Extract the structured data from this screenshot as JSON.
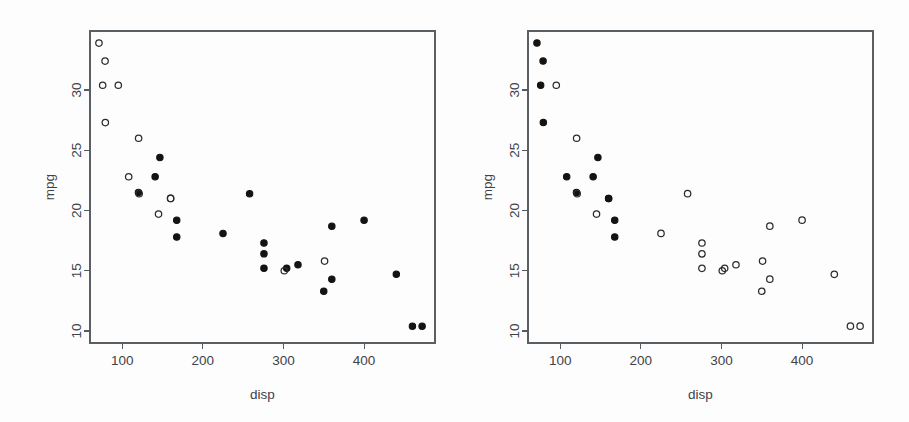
{
  "figure": {
    "kind": "two-panel-scatterplot",
    "background_color": "#fdfdfd",
    "foreground_color": "#2b2b2b",
    "panel_count": 2
  },
  "chart_data": [
    {
      "type": "scatter",
      "panel": "left",
      "title": "",
      "xlabel": "disp",
      "ylabel": "mpg",
      "xlim": [
        60,
        488
      ],
      "ylim": [
        9.0,
        34.9
      ],
      "xticks": [
        100,
        200,
        300,
        400
      ],
      "yticks": [
        10,
        15,
        20,
        25,
        30
      ],
      "xticklabels": [
        "100",
        "200",
        "300",
        "400"
      ],
      "yticklabels": [
        "10",
        "15",
        "20",
        "25",
        "30"
      ],
      "grid": false,
      "legend": "none",
      "marker_groups": [
        {
          "name": "open-circle",
          "fill": "none",
          "stroke": "#2b2b2b",
          "radius": 3.2
        },
        {
          "name": "filled-circle",
          "fill": "#131313",
          "stroke": "#131313",
          "radius": 3.2
        }
      ],
      "points": [
        {
          "x": 160.0,
          "y": 21.0,
          "marker": "open-circle"
        },
        {
          "x": 160.0,
          "y": 21.0,
          "marker": "open-circle"
        },
        {
          "x": 108.0,
          "y": 22.8,
          "marker": "open-circle"
        },
        {
          "x": 258.0,
          "y": 21.4,
          "marker": "filled-circle"
        },
        {
          "x": 360.0,
          "y": 18.7,
          "marker": "filled-circle"
        },
        {
          "x": 225.0,
          "y": 18.1,
          "marker": "filled-circle"
        },
        {
          "x": 360.0,
          "y": 14.3,
          "marker": "filled-circle"
        },
        {
          "x": 146.7,
          "y": 24.4,
          "marker": "filled-circle"
        },
        {
          "x": 140.8,
          "y": 22.8,
          "marker": "filled-circle"
        },
        {
          "x": 167.6,
          "y": 19.2,
          "marker": "filled-circle"
        },
        {
          "x": 167.6,
          "y": 17.8,
          "marker": "filled-circle"
        },
        {
          "x": 275.8,
          "y": 16.4,
          "marker": "filled-circle"
        },
        {
          "x": 275.8,
          "y": 17.3,
          "marker": "filled-circle"
        },
        {
          "x": 275.8,
          "y": 15.2,
          "marker": "filled-circle"
        },
        {
          "x": 472.0,
          "y": 10.4,
          "marker": "filled-circle"
        },
        {
          "x": 460.0,
          "y": 10.4,
          "marker": "filled-circle"
        },
        {
          "x": 440.0,
          "y": 14.7,
          "marker": "filled-circle"
        },
        {
          "x": 78.7,
          "y": 32.4,
          "marker": "open-circle"
        },
        {
          "x": 75.7,
          "y": 30.4,
          "marker": "open-circle"
        },
        {
          "x": 71.1,
          "y": 33.9,
          "marker": "open-circle"
        },
        {
          "x": 120.1,
          "y": 21.5,
          "marker": "filled-circle"
        },
        {
          "x": 318.0,
          "y": 15.5,
          "marker": "filled-circle"
        },
        {
          "x": 304.0,
          "y": 15.2,
          "marker": "filled-circle"
        },
        {
          "x": 350.0,
          "y": 13.3,
          "marker": "filled-circle"
        },
        {
          "x": 400.0,
          "y": 19.2,
          "marker": "filled-circle"
        },
        {
          "x": 79.0,
          "y": 27.3,
          "marker": "open-circle"
        },
        {
          "x": 120.3,
          "y": 26.0,
          "marker": "open-circle"
        },
        {
          "x": 95.1,
          "y": 30.4,
          "marker": "open-circle"
        },
        {
          "x": 351.0,
          "y": 15.8,
          "marker": "open-circle"
        },
        {
          "x": 145.0,
          "y": 19.7,
          "marker": "open-circle"
        },
        {
          "x": 301.0,
          "y": 15.0,
          "marker": "open-circle"
        },
        {
          "x": 121.0,
          "y": 21.4,
          "marker": "open-circle"
        }
      ]
    },
    {
      "type": "scatter",
      "panel": "right",
      "title": "",
      "xlabel": "disp",
      "ylabel": "mpg",
      "xlim": [
        60,
        488
      ],
      "ylim": [
        9.0,
        34.9
      ],
      "xticks": [
        100,
        200,
        300,
        400
      ],
      "yticks": [
        10,
        15,
        20,
        25,
        30
      ],
      "xticklabels": [
        "100",
        "200",
        "300",
        "400"
      ],
      "yticklabels": [
        "10",
        "15",
        "20",
        "25",
        "30"
      ],
      "grid": false,
      "legend": "none",
      "marker_groups": [
        {
          "name": "open-circle",
          "fill": "none",
          "stroke": "#2b2b2b",
          "radius": 3.2
        },
        {
          "name": "filled-circle",
          "fill": "#131313",
          "stroke": "#131313",
          "radius": 3.2
        }
      ],
      "points": [
        {
          "x": 160.0,
          "y": 21.0,
          "marker": "filled-circle"
        },
        {
          "x": 160.0,
          "y": 21.0,
          "marker": "filled-circle"
        },
        {
          "x": 108.0,
          "y": 22.8,
          "marker": "filled-circle"
        },
        {
          "x": 258.0,
          "y": 21.4,
          "marker": "open-circle"
        },
        {
          "x": 360.0,
          "y": 18.7,
          "marker": "open-circle"
        },
        {
          "x": 225.0,
          "y": 18.1,
          "marker": "open-circle"
        },
        {
          "x": 360.0,
          "y": 14.3,
          "marker": "open-circle"
        },
        {
          "x": 146.7,
          "y": 24.4,
          "marker": "filled-circle"
        },
        {
          "x": 140.8,
          "y": 22.8,
          "marker": "filled-circle"
        },
        {
          "x": 167.6,
          "y": 19.2,
          "marker": "filled-circle"
        },
        {
          "x": 167.6,
          "y": 17.8,
          "marker": "filled-circle"
        },
        {
          "x": 275.8,
          "y": 16.4,
          "marker": "open-circle"
        },
        {
          "x": 275.8,
          "y": 17.3,
          "marker": "open-circle"
        },
        {
          "x": 275.8,
          "y": 15.2,
          "marker": "open-circle"
        },
        {
          "x": 472.0,
          "y": 10.4,
          "marker": "open-circle"
        },
        {
          "x": 460.0,
          "y": 10.4,
          "marker": "open-circle"
        },
        {
          "x": 440.0,
          "y": 14.7,
          "marker": "open-circle"
        },
        {
          "x": 78.7,
          "y": 32.4,
          "marker": "filled-circle"
        },
        {
          "x": 75.7,
          "y": 30.4,
          "marker": "filled-circle"
        },
        {
          "x": 71.1,
          "y": 33.9,
          "marker": "filled-circle"
        },
        {
          "x": 120.1,
          "y": 21.5,
          "marker": "filled-circle"
        },
        {
          "x": 318.0,
          "y": 15.5,
          "marker": "open-circle"
        },
        {
          "x": 304.0,
          "y": 15.2,
          "marker": "open-circle"
        },
        {
          "x": 350.0,
          "y": 13.3,
          "marker": "open-circle"
        },
        {
          "x": 400.0,
          "y": 19.2,
          "marker": "open-circle"
        },
        {
          "x": 79.0,
          "y": 27.3,
          "marker": "filled-circle"
        },
        {
          "x": 120.3,
          "y": 26.0,
          "marker": "open-circle"
        },
        {
          "x": 95.1,
          "y": 30.4,
          "marker": "open-circle"
        },
        {
          "x": 351.0,
          "y": 15.8,
          "marker": "open-circle"
        },
        {
          "x": 145.0,
          "y": 19.7,
          "marker": "open-circle"
        },
        {
          "x": 301.0,
          "y": 15.0,
          "marker": "open-circle"
        },
        {
          "x": 121.0,
          "y": 21.4,
          "marker": "open-circle"
        }
      ]
    }
  ]
}
